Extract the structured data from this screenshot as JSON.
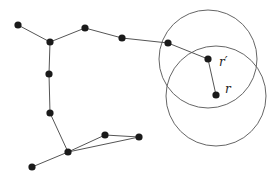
{
  "diagram": {
    "type": "graph",
    "colors": {
      "node": "#1a1a1a",
      "edge": "#555555",
      "circle": "#666666",
      "background": "#ffffff"
    },
    "nodes": [
      {
        "id": "A",
        "x": 18,
        "y": 25
      },
      {
        "id": "B",
        "x": 50,
        "y": 42
      },
      {
        "id": "C",
        "x": 85,
        "y": 28
      },
      {
        "id": "D",
        "x": 122,
        "y": 38
      },
      {
        "id": "E",
        "x": 168,
        "y": 43
      },
      {
        "id": "rp",
        "x": 208,
        "y": 59,
        "label": "r′"
      },
      {
        "id": "r",
        "x": 216,
        "y": 95,
        "label": "r"
      },
      {
        "id": "H",
        "x": 49,
        "y": 74
      },
      {
        "id": "I",
        "x": 50,
        "y": 113
      },
      {
        "id": "J",
        "x": 68,
        "y": 152
      },
      {
        "id": "K",
        "x": 32,
        "y": 167
      },
      {
        "id": "L",
        "x": 105,
        "y": 135
      },
      {
        "id": "M",
        "x": 139,
        "y": 137
      }
    ],
    "edges": [
      [
        "A",
        "B"
      ],
      [
        "B",
        "C"
      ],
      [
        "C",
        "D"
      ],
      [
        "D",
        "E"
      ],
      [
        "E",
        "rp"
      ],
      [
        "rp",
        "r"
      ],
      [
        "B",
        "H"
      ],
      [
        "H",
        "I"
      ],
      [
        "I",
        "J"
      ],
      [
        "J",
        "K"
      ],
      [
        "J",
        "L"
      ],
      [
        "L",
        "M"
      ],
      [
        "J",
        "M"
      ]
    ],
    "circles": [
      {
        "center": "rp",
        "cx": 208,
        "cy": 59,
        "r": 49
      },
      {
        "center": "r",
        "cx": 216,
        "cy": 96,
        "r": 50
      }
    ],
    "labels": [
      {
        "text": "r′",
        "x": 219,
        "y": 66
      },
      {
        "text": "r",
        "x": 225,
        "y": 93
      }
    ]
  }
}
